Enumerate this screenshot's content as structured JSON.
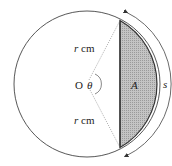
{
  "diagram": {
    "center_label": "O",
    "angle_label": "θ",
    "radius_label_top": "r cm",
    "radius_label_bottom": "r cm",
    "segment_label": "A",
    "arc_label": "s",
    "colors": {
      "segment_fill": "#b8b8b8",
      "stroke": "#333333",
      "dotted": "#777777"
    }
  }
}
